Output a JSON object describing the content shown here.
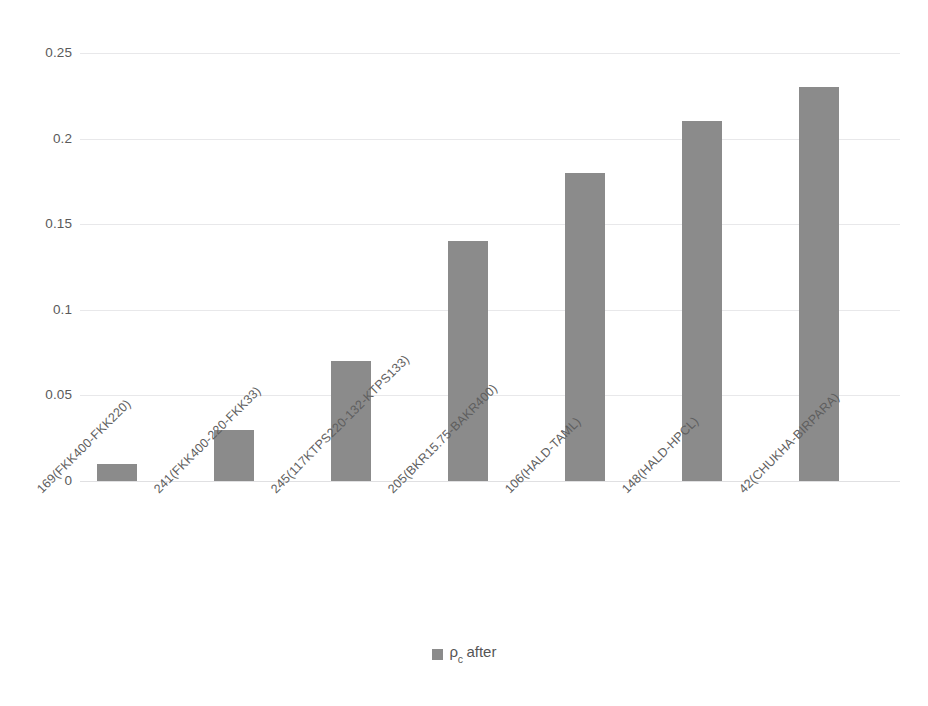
{
  "chart_data": {
    "type": "bar",
    "title": "",
    "xlabel": "",
    "ylabel": "",
    "ylim": [
      0,
      0.25
    ],
    "grid": true,
    "legend_position": "bottom-center",
    "series_color": "#8b8b8b",
    "categories": [
      "169(FKK400-FKK220)",
      "241(FKK400-220-FKK33)",
      "245(117KTPS220-132-KTPS133)",
      "205(BKR15.75-BAKR400)",
      "106(HALD-TAML)",
      "148(HALD-HPCL)",
      "42(CHUKHA-BIRPARA)"
    ],
    "series": [
      {
        "name": "ρc after",
        "name_base": "ρ",
        "name_sub": "c",
        "name_tail": "after",
        "values": [
          0.01,
          0.03,
          0.07,
          0.14,
          0.18,
          0.21,
          0.23
        ]
      }
    ],
    "yticks": [
      "0.25",
      "0.2",
      "0.15",
      "0.1",
      "0.05",
      "0"
    ],
    "ytick_values": [
      0.25,
      0.2,
      0.15,
      0.1,
      0.05,
      0
    ]
  },
  "legend": {
    "items": [
      {
        "label_base": "ρ",
        "label_sub": "c",
        "label_tail": "after",
        "color": "#8b8b8b"
      }
    ]
  }
}
